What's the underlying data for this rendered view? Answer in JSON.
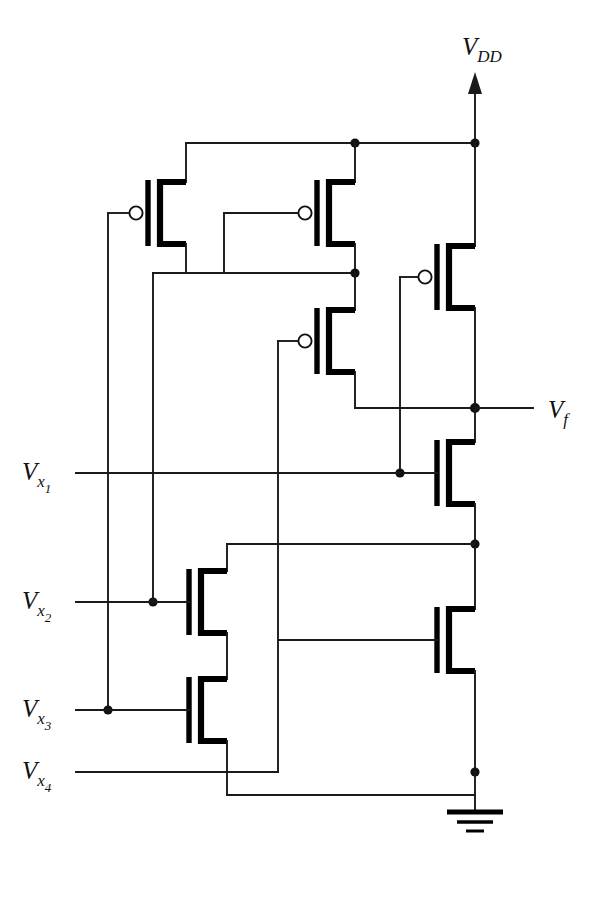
{
  "diagram": {
    "kind": "transistor-level-cmos-logic",
    "colors": {
      "wire": "#1a1a1a",
      "device": "#000000",
      "background": "#ffffff",
      "junction": "#111111"
    },
    "labels": {
      "vdd": {
        "base": "V",
        "sub": "DD",
        "x": 462,
        "y": 55
      },
      "vf": {
        "base": "V",
        "sub": "f",
        "x": 548,
        "y": 418
      },
      "vx1": {
        "base": "V",
        "sub": "x",
        "sub2": "1",
        "x": 22,
        "y": 480
      },
      "vx2": {
        "base": "V",
        "sub": "x",
        "sub2": "2",
        "x": 22,
        "y": 609
      },
      "vx3": {
        "base": "V",
        "sub": "x",
        "sub2": "3",
        "x": 22,
        "y": 717
      },
      "vx4": {
        "base": "V",
        "sub": "x",
        "sub2": "4",
        "x": 22,
        "y": 779
      }
    },
    "nets": {
      "supply_rail_y": 143,
      "output_node": {
        "x": 475,
        "y": 408
      },
      "ground_node": {
        "x": 475,
        "y": 772
      },
      "input_rows": [
        473,
        602,
        710,
        772
      ]
    },
    "transistors": [
      {
        "id": "P1",
        "type": "pmos",
        "gate_input": "Vx3",
        "x": 155,
        "y": 213
      },
      {
        "id": "P2",
        "type": "pmos",
        "gate_input": "Vx2",
        "x": 355,
        "y": 213
      },
      {
        "id": "P3",
        "type": "pmos",
        "gate_input": "Vx1",
        "x": 355,
        "y": 341
      },
      {
        "id": "P4",
        "type": "pmos",
        "gate_input": "Vx4",
        "x": 475,
        "y": 277
      },
      {
        "id": "N1",
        "type": "nmos",
        "gate_input": "Vx1",
        "x": 475,
        "y": 473
      },
      {
        "id": "N2",
        "type": "nmos",
        "gate_input": "Vx4",
        "x": 475,
        "y": 640
      },
      {
        "id": "N3",
        "type": "nmos",
        "gate_input": "Vx2",
        "x": 227,
        "y": 602
      },
      {
        "id": "N4",
        "type": "nmos",
        "gate_input": "Vx3",
        "x": 227,
        "y": 710
      }
    ],
    "ground_symbol": {
      "x": 475,
      "y": 812,
      "bars": 3
    }
  }
}
